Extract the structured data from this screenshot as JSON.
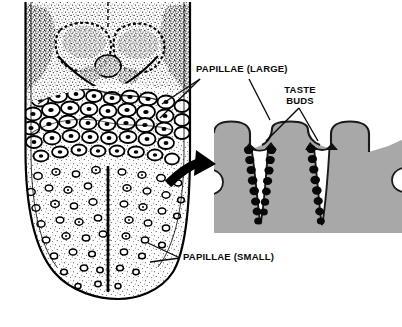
{
  "figure": {
    "background_color": "#ffffff",
    "ink_color": "#000000",
    "papilla_fill_color": "#a8a8a8",
    "papilla_outline_color": "#1a1a1a",
    "taste_bud_color": "#080808",
    "cleft_color": "#ffffff"
  },
  "labels": {
    "papillae_large": "PAPILLAE (LARGE)",
    "taste_buds_line1": "TASTE",
    "taste_buds_line2": "BUDS",
    "papillae_small": "PAPILLAE (SMALL)"
  },
  "diagrams": {
    "tongue": {
      "name": "dorsal tongue surface",
      "regions": [
        "stippled root region with lingual tonsil masses",
        "band of large circumvallate papillae",
        "field of small papillae with median sulcus"
      ]
    },
    "cross_section": {
      "name": "magnified cross-section of papillae",
      "papilla_count": 3,
      "cleft_count": 2,
      "taste_buds_per_cleft_wall": [
        8,
        7,
        8
      ],
      "arrow": "curved-arrow-pointing-right"
    }
  }
}
